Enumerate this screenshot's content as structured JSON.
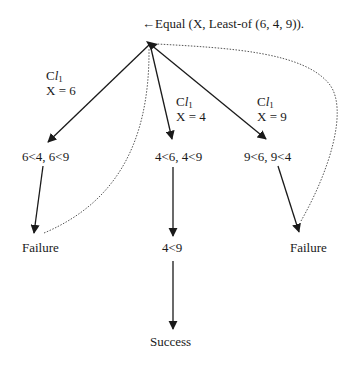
{
  "title": "←Equal (X, Least-of (6, 4, 9)).",
  "branches": [
    {
      "clause_prefix": "C",
      "clause_italic": "l",
      "clause_sub": "1",
      "binding": "X = 6",
      "condition": "6<4, 6<9",
      "result": "Failure"
    },
    {
      "clause_prefix": "C",
      "clause_italic": "l",
      "clause_sub": "1",
      "binding": "X = 4",
      "condition": "4<6, 4<9",
      "intermediate": "4<9",
      "result": "Success"
    },
    {
      "clause_prefix": "C",
      "clause_italic": "l",
      "clause_sub": "1",
      "binding": "X = 9",
      "condition": "9<6, 9<4",
      "result": "Failure"
    }
  ],
  "colors": {
    "line": "#1a1a1a",
    "backtrack": "#555555",
    "background": "#ffffff"
  }
}
